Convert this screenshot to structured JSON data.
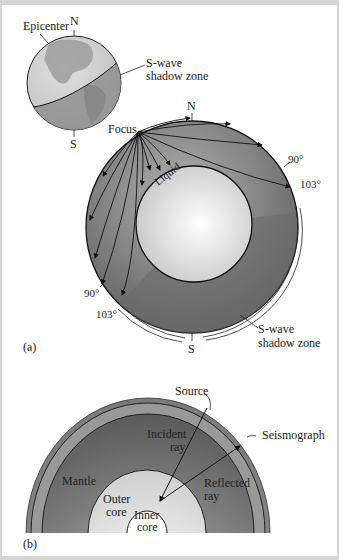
{
  "figure_a": {
    "panel_label": "(a)",
    "globe": {
      "north_label": "N",
      "south_label": "S",
      "epicenter_label": "Epicenter",
      "shadow_label_line1": "S-wave",
      "shadow_label_line2": "shadow zone"
    },
    "cross_section": {
      "focus_label": "Focus",
      "north_label": "N",
      "south_label": "S",
      "liquid_label": "Liquid",
      "angle_right_90": "90°",
      "angle_right_103": "103°",
      "angle_left_90": "90°",
      "angle_left_103": "103°",
      "shadow_label_line1": "S-wave",
      "shadow_label_line2": "shadow zone"
    }
  },
  "figure_b": {
    "panel_label": "(b)",
    "source_label": "Source",
    "seismograph_label": "Seismograph",
    "incident_line1": "Incident",
    "incident_line2": "ray",
    "reflected_line1": "Reflected",
    "reflected_line2": "ray",
    "mantle_label": "Mantle",
    "outer_core_line1": "Outer",
    "outer_core_line2": "core",
    "inner_core_line1": "Inner",
    "inner_core_line2": "core"
  },
  "colors": {
    "frame": "#d6d6d6",
    "mantle_dark": "#6e6e6e",
    "mantle_light": "#a8a8a8",
    "core_light": "#f4f4f4",
    "globe_light": "#cfcfcf",
    "shadow_zone": "#8a8a8a"
  }
}
